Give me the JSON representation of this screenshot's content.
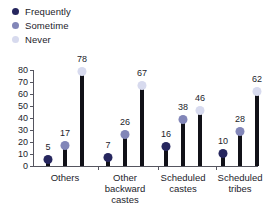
{
  "chart_data": {
    "type": "bar",
    "title": "",
    "subtitle": "",
    "xlabel": "",
    "ylabel": "",
    "ylim": [
      0,
      80
    ],
    "yticks": [
      0,
      10,
      20,
      30,
      40,
      50,
      60,
      70,
      80
    ],
    "grid": false,
    "legend_position": "top-left",
    "categories": [
      "Others",
      "Other\nbackward\ncastes",
      "Scheduled\ncastes",
      "Scheduled\ntribes"
    ],
    "series": [
      {
        "name": "Frequently",
        "color": "#26265e",
        "values": [
          5,
          7,
          16,
          10
        ]
      },
      {
        "name": "Sometime",
        "color": "#8286b8",
        "values": [
          17,
          26,
          38,
          28
        ]
      },
      {
        "name": "Never",
        "color": "#d7daee",
        "values": [
          78,
          67,
          46,
          62
        ]
      }
    ]
  },
  "colors": {
    "bar_stem": "#111118",
    "axis": "#55555f",
    "text": "#1c1c2b",
    "background": "#ffffff"
  }
}
